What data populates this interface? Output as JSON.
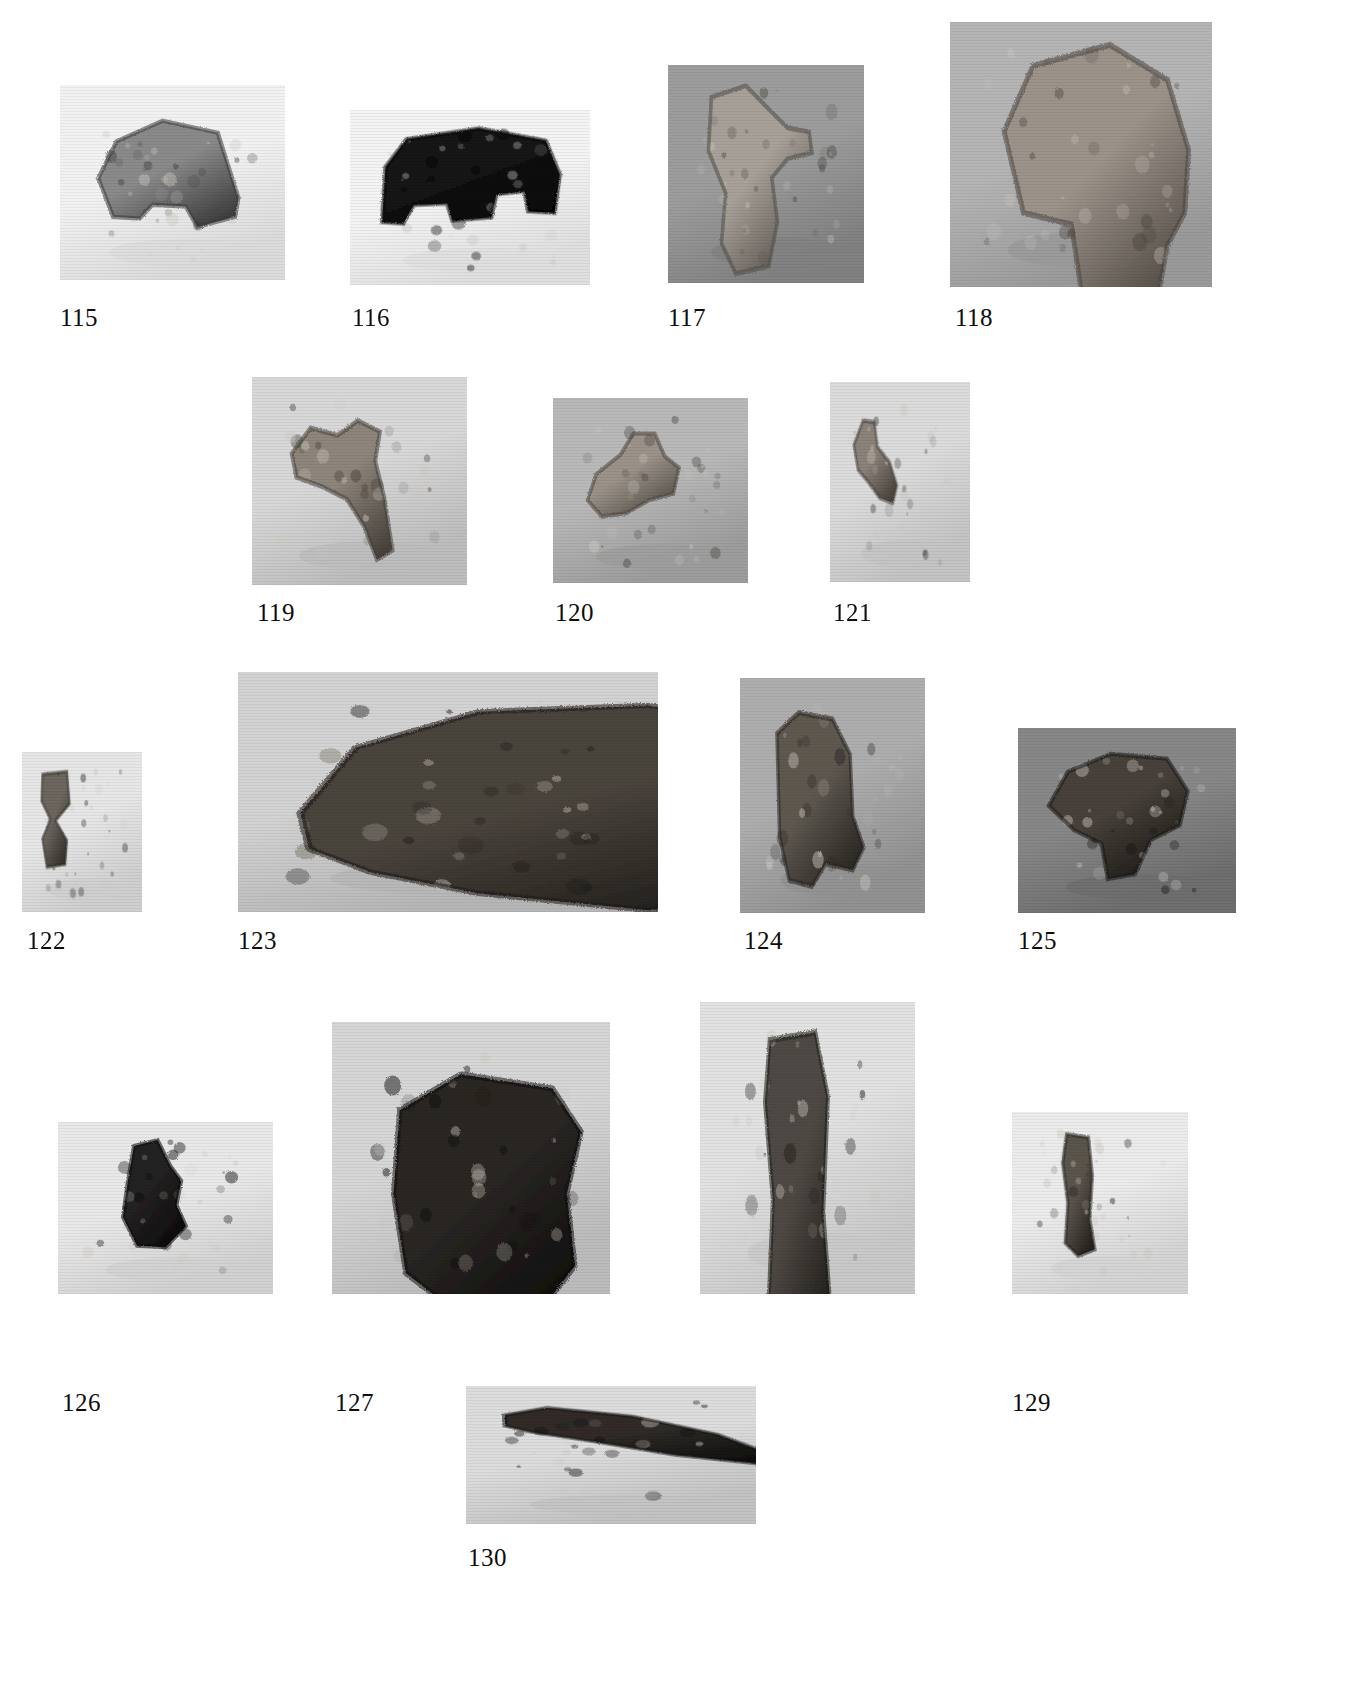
{
  "plate": {
    "kind": "photographic-specimen-plate",
    "background_color": "#ffffff",
    "caption_color": "#0d0d0d",
    "specimen_count": 16,
    "figure_number_range": "115-130",
    "rows": 5
  },
  "specimens": [
    {
      "number": "115",
      "row": 1,
      "panel": {
        "x": 60,
        "y": 85,
        "w": 225,
        "h": 195,
        "bg": "#f2f2f2",
        "shadow": "#dcdcdc"
      },
      "caption": {
        "x": 60,
        "y": 305
      },
      "object": {
        "tone": "#8a8a8a",
        "dark_tone": "#3a3a3a",
        "shape": "angular-bone-fragment-pointing-right",
        "outline": "M 30,95 L 52,52 L 108,28 L 175,42 L 200,118 L 196,140 L 150,152 L 136,128 L 96,126 L 80,142 L 48,140 Z"
      }
    },
    {
      "number": "116",
      "row": 1,
      "panel": {
        "x": 350,
        "y": 110,
        "w": 240,
        "h": 175,
        "bg": "#f4f4f4",
        "shadow": "#e0e0e0"
      },
      "caption": {
        "x": 352,
        "y": 305
      },
      "object": {
        "tone": "#141414",
        "dark_tone": "#060606",
        "shape": "dark-silhouette-vertebra-two-legs",
        "outline": "M 24,60 L 48,24 L 130,10 L 206,26 L 222,70 L 216,120 L 186,118 L 182,92 L 150,96 L 144,126 L 100,130 L 94,108 L 56,110 L 44,134 L 20,132 Z"
      }
    },
    {
      "number": "117",
      "row": 1,
      "panel": {
        "x": 668,
        "y": 65,
        "w": 196,
        "h": 218,
        "bg": "#9d9d9d",
        "shadow": "#828282"
      },
      "caption": {
        "x": 668,
        "y": 305
      },
      "object": {
        "tone": "#a8a19a",
        "dark_tone": "#514c46",
        "shape": "light-bone-with-lateral-process",
        "outline": "M 44,20 L 92,8 L 126,34 L 150,52 L 180,56 L 184,78 L 150,84 L 128,104 L 136,150 L 124,196 L 78,204 L 58,172 L 64,120 L 40,76 Z"
      }
    },
    {
      "number": "118",
      "row": 1,
      "panel": {
        "x": 950,
        "y": 22,
        "w": 262,
        "h": 265,
        "bg": "#b5b5b5",
        "shadow": "#9a9a9a"
      },
      "caption": {
        "x": 955,
        "y": 305
      },
      "object": {
        "tone": "#9c938a",
        "dark_tone": "#4a443e",
        "shape": "large-bone-epiphysis-wide-head",
        "outline": "M 40,80 L 70,24 L 150,6 L 210,36 L 232,96 L 228,150 L 210,178 L 198,232 L 150,248 L 120,216 L 110,160 L 60,150 Z"
      }
    },
    {
      "number": "119",
      "row": 2,
      "panel": {
        "x": 252,
        "y": 377,
        "w": 215,
        "h": 208,
        "bg": "#d8d8d8",
        "shadow": "#bdbdbd"
      },
      "caption": {
        "x": 257,
        "y": 600
      },
      "object": {
        "tone": "#8e857b",
        "dark_tone": "#46413b",
        "shape": "hooked-bone-fragment-with-spur",
        "outline": "M 34,70 L 58,42 L 92,50 L 118,34 L 146,46 L 140,78 L 152,120 L 162,176 L 142,186 L 126,150 L 104,120 L 72,106 L 40,96 Z"
      }
    },
    {
      "number": "120",
      "row": 2,
      "panel": {
        "x": 553,
        "y": 398,
        "w": 195,
        "h": 185,
        "bg": "#b9b9b9",
        "shadow": "#9d9d9d"
      },
      "caption": {
        "x": 555,
        "y": 600
      },
      "object": {
        "tone": "#9b938a",
        "dark_tone": "#4c463f",
        "shape": "knobbed-articular-end",
        "outline": "M 32,112 L 44,80 L 78,56 L 96,30 L 126,30 L 140,58 L 160,72 L 152,104 L 118,112 L 86,128 L 52,132 Z"
      }
    },
    {
      "number": "121",
      "row": 2,
      "panel": {
        "x": 830,
        "y": 382,
        "w": 140,
        "h": 200,
        "bg": "#dcdcdc",
        "shadow": "#c4c4c4"
      },
      "caption": {
        "x": 833,
        "y": 600
      },
      "object": {
        "tone": "#8b837a",
        "dark_tone": "#46403a",
        "shape": "small-y-shaped-bone",
        "outline": "M 30,58 L 48,30 L 70,32 L 76,60 L 100,78 L 114,104 L 106,124 L 80,118 L 58,100 L 38,86 Z"
      }
    },
    {
      "number": "122",
      "row": 3,
      "panel": {
        "x": 22,
        "y": 752,
        "w": 120,
        "h": 160,
        "bg": "#e7e7e7",
        "shadow": "#cfcfcf"
      },
      "caption": {
        "x": 27,
        "y": 928
      },
      "object": {
        "tone": "#6d665f",
        "dark_tone": "#2e2b27",
        "shape": "narrow-waisted-shaft",
        "outline": "M 30,18 L 86,14 L 92,60 L 60,84 L 86,112 L 82,146 L 40,150 L 30,110 L 48,82 L 28,56 Z"
      }
    },
    {
      "number": "123",
      "row": 3,
      "panel": {
        "x": 238,
        "y": 672,
        "w": 420,
        "h": 240,
        "bg": "#d3d3d3",
        "shadow": "#b6b6b6"
      },
      "caption": {
        "x": 238,
        "y": 928
      },
      "object": {
        "tone": "#4a443d",
        "dark_tone": "#1c1a17",
        "shape": "large-horizontal-skull-fragment",
        "outline": "M 24,120 L 60,58 L 140,24 L 250,18 L 330,36 L 380,84 L 392,150 L 356,196 L 250,212 L 140,196 L 70,176 L 30,154 Z"
      }
    },
    {
      "number": "124",
      "row": 3,
      "panel": {
        "x": 740,
        "y": 678,
        "w": 185,
        "h": 235,
        "bg": "#aeaeae",
        "shadow": "#929292"
      },
      "caption": {
        "x": 744,
        "y": 928
      },
      "object": {
        "tone": "#5e5850",
        "dark_tone": "#262320",
        "shape": "cylindrical-bone-end-with-flange",
        "outline": "M 38,40 L 70,20 L 120,26 L 146,60 L 150,120 L 166,150 L 150,172 L 110,166 L 90,188 L 56,182 L 42,140 Z"
      }
    },
    {
      "number": "125",
      "row": 3,
      "panel": {
        "x": 1018,
        "y": 728,
        "w": 218,
        "h": 185,
        "bg": "#878787",
        "shadow": "#6e6e6e"
      },
      "caption": {
        "x": 1018,
        "y": 928
      },
      "object": {
        "tone": "#46403a",
        "dark_tone": "#1a1815",
        "shape": "rough-bone-head-with-pits",
        "outline": "M 22,82 L 46,40 L 100,18 L 170,24 L 196,64 L 186,106 L 150,124 L 130,166 L 96,172 L 88,128 L 54,112 Z"
      }
    },
    {
      "number": "126",
      "row": 4,
      "panel": {
        "x": 58,
        "y": 1122,
        "w": 215,
        "h": 172,
        "bg": "#e9e9e9",
        "shadow": "#d2d2d2"
      },
      "caption": {
        "x": 62,
        "y": 1390
      },
      "object": {
        "tone": "#232020",
        "dark_tone": "#0b0a0a",
        "shape": "dark-tapered-fragment",
        "outline": "M 80,18 L 110,10 L 126,44 L 140,64 L 134,96 L 146,124 L 120,152 L 84,150 L 66,112 L 72,66 Z"
      }
    },
    {
      "number": "127",
      "row": 4,
      "panel": {
        "x": 332,
        "y": 1022,
        "w": 278,
        "h": 272,
        "bg": "#d6d6d6",
        "shadow": "#bcbcbc"
      },
      "caption": {
        "x": 335,
        "y": 1390
      },
      "object": {
        "tone": "#2b2724",
        "dark_tone": "#0e0d0c",
        "shape": "large-dark-vertebral-centrum",
        "outline": "M 50,60 L 110,30 L 200,42 L 228,78 L 214,130 L 222,190 L 188,228 L 110,232 L 56,196 L 44,130 Z"
      }
    },
    {
      "number": "128",
      "row": 4,
      "panel": {
        "x": 700,
        "y": 1002,
        "w": 215,
        "h": 292,
        "bg": "#e2e2e2",
        "shadow": "#c9c9c9"
      },
      "caption": {
        "x": 703,
        "y": 1390
      },
      "object": {
        "tone": "#4f4a44",
        "dark_tone": "#1d1b18",
        "shape": "long-vertical-limb-shaft",
        "outline": "M 72,16 L 130,10 L 146,60 L 140,150 L 150,230 L 130,266 L 86,268 L 70,230 L 76,140 L 66,64 Z"
      }
    },
    {
      "number": "129",
      "row": 4,
      "panel": {
        "x": 1012,
        "y": 1112,
        "w": 176,
        "h": 182,
        "bg": "#ececec",
        "shadow": "#d4d4d4"
      },
      "caption": {
        "x": 1012,
        "y": 1390
      },
      "object": {
        "tone": "#5a544c",
        "dark_tone": "#221f1c",
        "shape": "slender-vertical-bone-shaft",
        "outline": "M 68,14 L 102,18 L 108,66 L 104,120 L 112,158 L 86,166 L 66,150 L 70,100 L 62,50 Z"
      }
    },
    {
      "number": "130",
      "row": 5,
      "panel": {
        "x": 466,
        "y": 1386,
        "w": 290,
        "h": 138,
        "bg": "#dddddd",
        "shadow": "#c3c3c3"
      },
      "caption": {
        "x": 468,
        "y": 1545
      },
      "object": {
        "tone": "#302c28",
        "dark_tone": "#100f0e",
        "shape": "curved-tusk-or-claw",
        "outline": "M 20,34 L 60,22 L 140,36 L 220,66 L 266,96 L 256,114 L 180,100 L 104,78 L 44,62 L 20,52 Z"
      }
    }
  ]
}
